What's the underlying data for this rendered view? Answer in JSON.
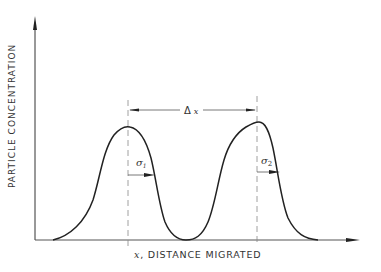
{
  "diagram": {
    "y_axis_label": "PARTICLE CONCENTRATION",
    "x_axis_label": "x, DISTANCE MIGRATED",
    "x_axis_var": "x",
    "x_axis_rest": ", DISTANCE MIGRATED",
    "delta_label": "Δ x",
    "delta_sym": "Δ",
    "delta_var": "x",
    "sigma1_label": "σ1",
    "sigma1_sym": "σ",
    "sigma1_sub": "1",
    "sigma2_label": "σ2",
    "sigma2_sym": "σ",
    "sigma2_sub": "2",
    "line_color": "#222222",
    "dash_color": "#888888",
    "peaks": [
      {
        "name": "peak-1",
        "center_x": 128,
        "peak_y": 127,
        "sigma_label": "σ1"
      },
      {
        "name": "peak-2",
        "center_x": 257,
        "peak_y": 122,
        "sigma_label": "σ2"
      }
    ]
  }
}
